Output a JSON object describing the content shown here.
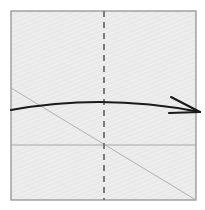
{
  "figure": {
    "title": "Origami fold step diagram",
    "canvas": {
      "width": 205,
      "height": 210,
      "background": "#ffffff"
    },
    "paper": {
      "name": "square-sheet",
      "x": 11,
      "y": 11,
      "width": 185,
      "height": 189,
      "fill": "#e8e8e8",
      "stroke": "#8c8c8c",
      "stroke_width": 1.2,
      "texture": "diagonal-hatch"
    },
    "creases": [
      {
        "name": "vertical-center-crease",
        "style": "dashed",
        "color": "#7a7a7a",
        "width": 2,
        "dash": "6 5",
        "x1": 104,
        "y1": 11,
        "x2": 104,
        "y2": 200
      },
      {
        "name": "horizontal-crease",
        "style": "solid",
        "color": "#a9a9a9",
        "width": 1,
        "x1": 11,
        "y1": 145,
        "x2": 196,
        "y2": 145
      },
      {
        "name": "diagonal-crease",
        "style": "solid",
        "color": "#b0b0b0",
        "width": 1,
        "x1": 11,
        "y1": 88,
        "x2": 196,
        "y2": 200
      }
    ],
    "arrow": {
      "name": "fold-direction-arrow",
      "color": "#1a1a1a",
      "width": 2.1,
      "path": "M 11 110 Q 104 93 200 112",
      "head": {
        "tip_x": 200,
        "tip_y": 112,
        "upper_barb_x": 171,
        "upper_barb_y": 97,
        "lower_barb_x": 169,
        "lower_barb_y": 113
      }
    }
  }
}
